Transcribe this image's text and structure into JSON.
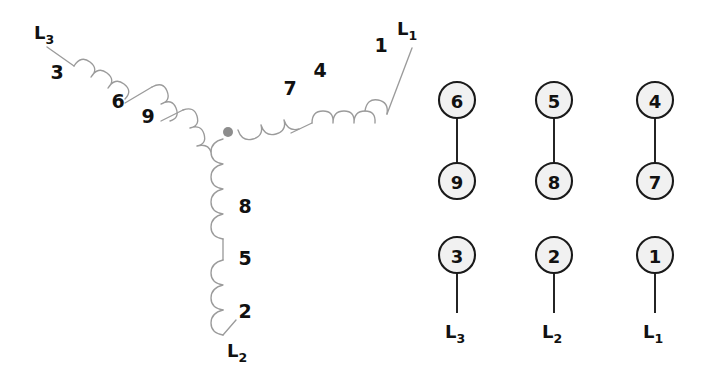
{
  "diagram": {
    "background_color": "#ffffff",
    "coil_color": "#9b9b9b",
    "label_color": "#111111",
    "terminal_fill": "#f1f1f1",
    "terminal_stroke": "#1a1a1a",
    "node_color": "#8d8d8d"
  },
  "star": {
    "center_node_label": "star-point",
    "branches": [
      {
        "name": "branch-l3",
        "line_label": "L",
        "line_sub": "3",
        "coil_labels": [
          "3",
          "6",
          "9"
        ]
      },
      {
        "name": "branch-l1",
        "line_label": "L",
        "line_sub": "1",
        "coil_labels": [
          "7",
          "4",
          "1"
        ]
      },
      {
        "name": "branch-l2",
        "line_label": "L",
        "line_sub": "2",
        "coil_labels": [
          "8",
          "5",
          "2"
        ]
      }
    ]
  },
  "terminal_block": {
    "paired_groups": [
      {
        "name": "pair-6-9",
        "top": "6",
        "bottom": "9"
      },
      {
        "name": "pair-5-8",
        "top": "5",
        "bottom": "8"
      },
      {
        "name": "pair-4-7",
        "top": "4",
        "bottom": "7"
      }
    ],
    "line_terminals": [
      {
        "name": "terminal-3",
        "number": "3",
        "line_label": "L",
        "line_sub": "3"
      },
      {
        "name": "terminal-2",
        "number": "2",
        "line_label": "L",
        "line_sub": "2"
      },
      {
        "name": "terminal-1",
        "number": "1",
        "line_label": "L",
        "line_sub": "1"
      }
    ]
  },
  "labels": {
    "star_coil_l3_1": "3",
    "star_coil_l3_2": "6",
    "star_coil_l3_3": "9",
    "star_coil_l1_1": "7",
    "star_coil_l1_2": "4",
    "star_coil_l1_3": "1",
    "star_coil_l2_1": "8",
    "star_coil_l2_2": "5",
    "star_coil_l2_3": "2"
  }
}
